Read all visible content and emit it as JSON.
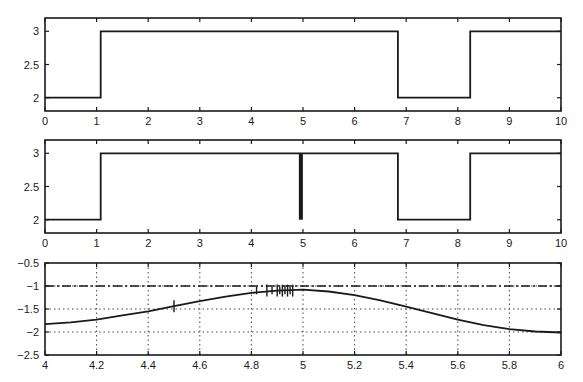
{
  "chart_data": [
    {
      "type": "line",
      "title": "",
      "xlabel": "",
      "ylabel": "",
      "xlim": [
        0,
        10
      ],
      "ylim": [
        1.8,
        3.2
      ],
      "xticks": [
        0,
        1,
        2,
        3,
        4,
        5,
        6,
        7,
        8,
        9,
        10
      ],
      "yticks": [
        2,
        2.5,
        3
      ],
      "ytick_labels": [
        "2",
        "2.5",
        "3"
      ],
      "grid": false,
      "series": [
        {
          "name": "mode signal",
          "style": "step",
          "x": [
            0,
            1.08,
            1.08,
            6.84,
            6.84,
            8.24,
            8.24,
            10
          ],
          "y": [
            2,
            2,
            3,
            3,
            2,
            2,
            3,
            3
          ]
        }
      ]
    },
    {
      "type": "line",
      "title": "",
      "xlabel": "",
      "ylabel": "",
      "xlim": [
        0,
        10
      ],
      "ylim": [
        1.8,
        3.2
      ],
      "xticks": [
        0,
        1,
        2,
        3,
        4,
        5,
        6,
        7,
        8,
        9,
        10
      ],
      "yticks": [
        2,
        2.5,
        3
      ],
      "ytick_labels": [
        "2",
        "2.5",
        "3"
      ],
      "grid": false,
      "series": [
        {
          "name": "mode signal with chattering",
          "style": "step",
          "x": [
            0,
            1.08,
            1.08,
            6.84,
            6.84,
            8.24,
            8.24,
            10
          ],
          "y": [
            2,
            2,
            3,
            3,
            2,
            2,
            3,
            3
          ]
        }
      ],
      "annotations": [
        {
          "type": "chattering_band",
          "x_start": 4.92,
          "x_end": 4.96,
          "y_range": [
            2,
            3
          ]
        }
      ]
    },
    {
      "type": "line",
      "title": "",
      "xlabel": "",
      "ylabel": "",
      "xlim": [
        4,
        6
      ],
      "ylim": [
        -2.5,
        -0.5
      ],
      "xticks": [
        4,
        4.2,
        4.4,
        4.6,
        4.8,
        5,
        5.2,
        5.4,
        5.6,
        5.8,
        6
      ],
      "xtick_labels": [
        "4",
        "4.2",
        "4.4",
        "4.6",
        "4.8",
        "5",
        "5.2",
        "5.4",
        "5.6",
        "5.8",
        "6"
      ],
      "yticks": [
        -2.5,
        -2,
        -1.5,
        -1,
        -0.5
      ],
      "ytick_labels": [
        "-2.5",
        "-2",
        "-1.5",
        "-1",
        "-0.5"
      ],
      "grid": true,
      "series": [
        {
          "name": "trajectory",
          "style": "solid",
          "x": [
            4.0,
            4.1,
            4.2,
            4.3,
            4.4,
            4.5,
            4.6,
            4.7,
            4.8,
            4.9,
            5.0,
            5.1,
            5.2,
            5.3,
            5.4,
            5.5,
            5.6,
            5.7,
            5.8,
            5.9,
            6.0
          ],
          "y": [
            -1.83,
            -1.79,
            -1.73,
            -1.64,
            -1.55,
            -1.44,
            -1.33,
            -1.23,
            -1.15,
            -1.1,
            -1.08,
            -1.12,
            -1.2,
            -1.31,
            -1.45,
            -1.59,
            -1.73,
            -1.85,
            -1.94,
            -1.99,
            -2.01
          ]
        },
        {
          "name": "reference",
          "style": "dashdot",
          "x": [
            4,
            6
          ],
          "y": [
            -1,
            -1
          ]
        }
      ],
      "annotations": [
        {
          "type": "noise_spikes",
          "x_range": [
            4.82,
            4.96
          ],
          "amplitude": 0.12
        }
      ]
    }
  ]
}
